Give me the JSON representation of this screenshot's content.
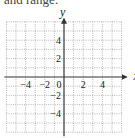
{
  "caption": "and range.",
  "chart_data": {
    "type": "scatter",
    "title": "",
    "xlabel": "x",
    "ylabel": "y",
    "xlim": [
      -6,
      6
    ],
    "ylim": [
      -6,
      6
    ],
    "grid": true,
    "grid_step": 1,
    "x_ticks": [
      {
        "value": -4,
        "label": "−4"
      },
      {
        "value": -2,
        "label": "−2"
      },
      {
        "value": 0,
        "label": "0"
      },
      {
        "value": 2,
        "label": "2"
      },
      {
        "value": 4,
        "label": "4"
      }
    ],
    "y_ticks": [
      {
        "value": 4,
        "label": "4"
      },
      {
        "value": 2,
        "label": "2"
      },
      {
        "value": -2,
        "label": "−2"
      },
      {
        "value": -4,
        "label": "−4"
      }
    ],
    "series": [],
    "colors": {
      "axis": "#333333",
      "grid": "#9a9a9a"
    }
  }
}
